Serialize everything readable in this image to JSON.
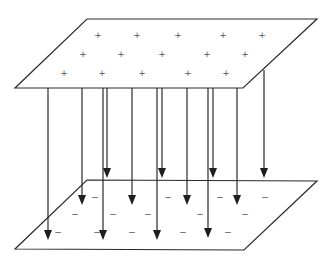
{
  "diagram": {
    "colors": {
      "stroke": "#2a2a2a",
      "charge": "#555555",
      "background": "#ffffff"
    },
    "top_plate": {
      "label": "positive plate",
      "polygon": [
        [
          87,
          19
        ],
        [
          317,
          19
        ],
        [
          243,
          88
        ],
        [
          15,
          88
        ]
      ],
      "charge_symbol": "+",
      "charges": [
        [
          98,
          35
        ],
        [
          137,
          35
        ],
        [
          178,
          35
        ],
        [
          223,
          35
        ],
        [
          262,
          35
        ],
        [
          83,
          54
        ],
        [
          121,
          54
        ],
        [
          162,
          54
        ],
        [
          207,
          54
        ],
        [
          245,
          54
        ],
        [
          64,
          73
        ],
        [
          102,
          73
        ],
        [
          142,
          73
        ],
        [
          188,
          73
        ],
        [
          226,
          73
        ]
      ]
    },
    "bottom_plate": {
      "label": "negative plate",
      "polygon": [
        [
          87,
          180
        ],
        [
          317,
          181
        ],
        [
          244,
          250
        ],
        [
          15,
          249
        ]
      ],
      "charge_symbol": "−",
      "charges": [
        [
          95,
          197
        ],
        [
          168,
          197
        ],
        [
          220,
          197
        ],
        [
          265,
          197
        ],
        [
          75,
          214
        ],
        [
          113,
          214
        ],
        [
          148,
          214
        ],
        [
          200,
          214
        ],
        [
          245,
          214
        ],
        [
          58,
          232
        ],
        [
          97,
          232
        ],
        [
          132,
          232
        ],
        [
          183,
          232
        ],
        [
          228,
          232
        ]
      ]
    },
    "field_lines": [
      {
        "x": 48,
        "y1": 88,
        "y2": 240
      },
      {
        "x": 82,
        "y1": 88,
        "y2": 205
      },
      {
        "x": 103,
        "y1": 88,
        "y2": 240
      },
      {
        "x": 107,
        "y1": 88,
        "y2": 178
      },
      {
        "x": 132,
        "y1": 88,
        "y2": 205
      },
      {
        "x": 157,
        "y1": 88,
        "y2": 240
      },
      {
        "x": 162,
        "y1": 88,
        "y2": 178
      },
      {
        "x": 187,
        "y1": 88,
        "y2": 205
      },
      {
        "x": 208,
        "y1": 88,
        "y2": 238
      },
      {
        "x": 213,
        "y1": 88,
        "y2": 178
      },
      {
        "x": 237,
        "y1": 88,
        "y2": 205
      },
      {
        "x": 264,
        "y1": 70,
        "y2": 178
      }
    ]
  }
}
